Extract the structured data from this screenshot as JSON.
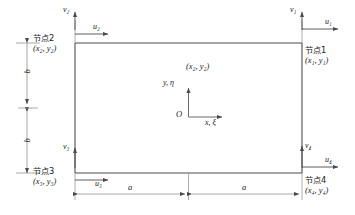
{
  "figure": {
    "type": "finite-element-rectangular-element-diagram",
    "colors": {
      "element_outline": "#4d4d4d",
      "axis_line": "#808080",
      "dimension_line": "#8c8c8c",
      "text": "#1a1a1a",
      "background": "#ffffff"
    },
    "nodes": [
      {
        "id": "node1",
        "name_label": "节点1",
        "coord_label": "(x₁, y₁)",
        "position": "top-right",
        "dof_u": "u₁",
        "dof_v": "v₁"
      },
      {
        "id": "node2",
        "name_label": "节点2",
        "coord_label": "(x₂, y₂)",
        "position": "top-left",
        "dof_u": "u₂",
        "dof_v": "v₂"
      },
      {
        "id": "node3",
        "name_label": "节点3",
        "coord_label": "(x₃, y₃)",
        "position": "bottom-left",
        "dof_u": "u₃",
        "dof_v": "v₃"
      },
      {
        "id": "node4",
        "name_label": "节点4",
        "coord_label": "(x₄, y₄)",
        "position": "bottom-right",
        "dof_u": "u₄",
        "dof_v": "v₄"
      }
    ],
    "local_axes": {
      "origin_label": "O",
      "x_axis_label": "x, ξ",
      "y_axis_label": "y, η",
      "center_point_label": "(x₂, y₂)"
    },
    "dimensions": {
      "horizontal_left": "a",
      "horizontal_right": "a",
      "vertical_upper": "b",
      "vertical_lower": "b"
    }
  }
}
